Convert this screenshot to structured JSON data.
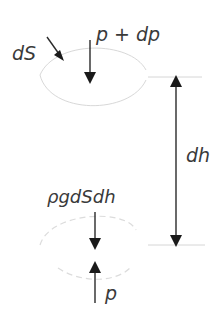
{
  "diagram": {
    "labels": {
      "area": "dS",
      "top_pressure": "p + dp",
      "height": "dh",
      "weight": "ρgdSdh",
      "bottom_pressure": "p"
    },
    "colors": {
      "arrow": "#1a1a1a",
      "ellipse": "#d8d8d8",
      "text": "#3a3a3a"
    },
    "elements": [
      {
        "id": "top-surface",
        "type": "ellipse",
        "style": "solid-light"
      },
      {
        "id": "bottom-surface",
        "type": "ellipse",
        "style": "dashed-light"
      },
      {
        "id": "area-pointer",
        "type": "arrow",
        "points_to": "top-surface",
        "label": "dS"
      },
      {
        "id": "top-force",
        "type": "arrow",
        "direction": "down",
        "label": "p + dp"
      },
      {
        "id": "height-dimension",
        "type": "double-arrow",
        "direction": "vertical",
        "label": "dh"
      },
      {
        "id": "weight-force",
        "type": "arrow",
        "direction": "down",
        "label": "ρgdSdh"
      },
      {
        "id": "bottom-force",
        "type": "arrow",
        "direction": "up",
        "label": "p"
      }
    ]
  }
}
